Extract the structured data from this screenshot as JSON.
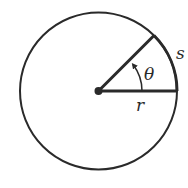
{
  "diagram": {
    "labels": {
      "angle": "θ",
      "arc": "s",
      "radius": "r"
    },
    "colors": {
      "stroke": "#2a2a2a",
      "background": "#ffffff"
    }
  }
}
